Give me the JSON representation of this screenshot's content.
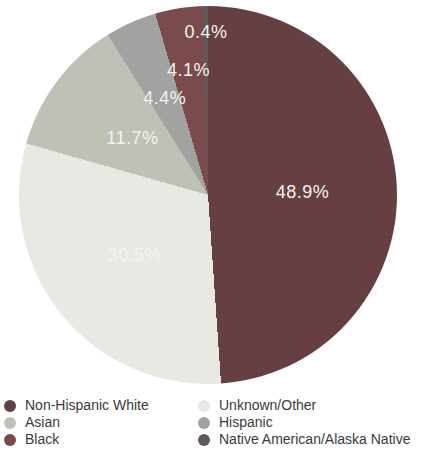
{
  "chart_data": {
    "type": "pie",
    "title": "",
    "direction": "clockwise",
    "start_angle_deg": 0,
    "label_color": "#f4f3f1",
    "slices": [
      {
        "label": "Non-Hispanic White",
        "value": 48.9,
        "display": "48.9%",
        "color": "#653f41",
        "label_r": 0.5
      },
      {
        "label": "Unknown/Other",
        "value": 30.5,
        "display": "30.5%",
        "color": "#eae8e3",
        "label_r": 0.5
      },
      {
        "label": "Asian",
        "value": 11.7,
        "display": "11.7%",
        "color": "#bdc1b6",
        "label_r": 0.5
      },
      {
        "label": "Hispanic",
        "value": 4.4,
        "display": "4.4%",
        "color": "#a2a2a0",
        "label_r": 0.56
      },
      {
        "label": "Black",
        "value": 4.1,
        "display": "4.1%",
        "color": "#7b4a4c",
        "label_r": 0.67
      },
      {
        "label": "Native American/Alaska Native",
        "value": 0.4,
        "display": "0.4%",
        "color": "#5f5a59",
        "label_r": 0.86
      }
    ],
    "legend": {
      "position": "bottom",
      "text_color": "#3b3b3b",
      "columns": [
        [
          0,
          2,
          4
        ],
        [
          1,
          3,
          5
        ]
      ]
    }
  }
}
